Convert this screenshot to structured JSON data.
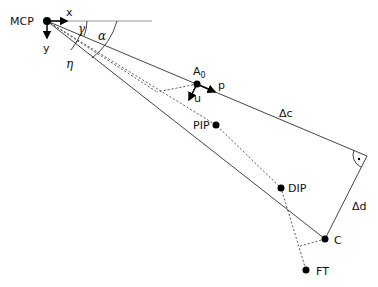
{
  "diagram": {
    "points": {
      "mcp": {
        "label": "MCP",
        "x": 47,
        "y": 21
      },
      "a0": {
        "label": "A",
        "sub": "0",
        "x": 197,
        "y": 84
      },
      "pip": {
        "label": "PIP",
        "x": 216,
        "y": 125
      },
      "dip": {
        "label": "DIP",
        "x": 281,
        "y": 188
      },
      "c": {
        "label": "C",
        "x": 325,
        "y": 239
      },
      "ft": {
        "label": "FT",
        "x": 306,
        "y": 270
      }
    },
    "axes": {
      "x_label": "x",
      "y_label": "y"
    },
    "angles": {
      "gamma": "γ",
      "alpha": "α",
      "eta": "η"
    },
    "vectors": {
      "p": "p",
      "u": "u"
    },
    "segments": {
      "delta_c": "Δc",
      "delta_d": "Δd"
    },
    "right_angle_marker": "·",
    "colors": {
      "line": "#444444",
      "point": "#000000"
    }
  }
}
